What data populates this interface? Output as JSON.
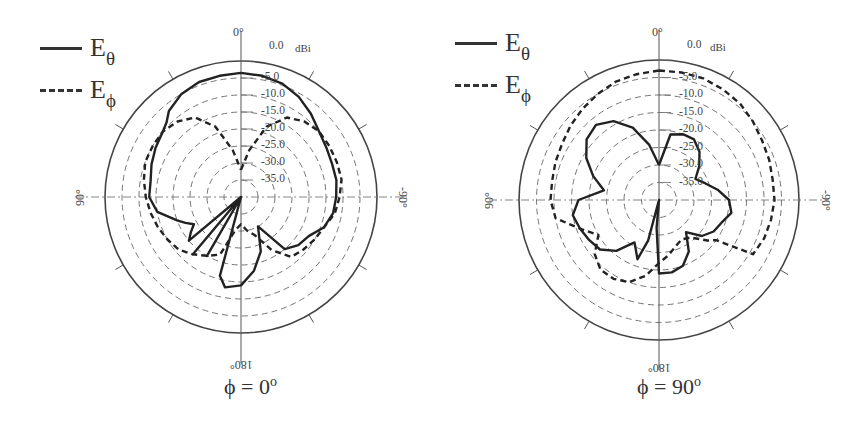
{
  "figure": {
    "unit_label": "dBi",
    "legend": [
      {
        "name": "E",
        "sub": "θ",
        "style": "solid"
      },
      {
        "name": "E",
        "sub": "ϕ",
        "style": "dashed"
      }
    ],
    "angle_labels": {
      "top": "0°",
      "left": "90°",
      "right": "-90°",
      "bottom": "180°"
    },
    "ring_labels": [
      "0.0",
      "-5.0",
      "-10.0",
      "-15.0",
      "-20.0",
      "-25.0",
      "-30.0",
      "-35.0"
    ]
  },
  "panels": [
    {
      "caption": "ϕ = 0",
      "caption_sup": "o"
    },
    {
      "caption": "ϕ = 90",
      "caption_sup": "o"
    }
  ],
  "chart_data": [
    {
      "type": "polar-line",
      "title": "ϕ = 0°",
      "radial_unit": "dBi",
      "rlim": [
        -40,
        0
      ],
      "radial_ticks": [
        0,
        -5,
        -10,
        -15,
        -20,
        -25,
        -30,
        -35
      ],
      "angle_ticks": [
        "0°",
        "90°",
        "180°",
        "-90°"
      ],
      "angle_convention": "theta in degrees, 0 at top, positive toward left (90° on left, -90° on right)",
      "legend_position": "top-left",
      "grid": true,
      "series": [
        {
          "name": "Eθ",
          "style": "solid",
          "theta": [
            0,
            -10,
            -20,
            -30,
            -40,
            -50,
            -60,
            -70,
            -80,
            -90,
            -100,
            -110,
            -120,
            -130,
            -140,
            -150,
            -160,
            -170,
            180,
            170,
            165,
            160,
            150,
            145,
            140,
            135,
            130,
            125,
            120,
            115,
            110,
            100,
            90,
            80,
            70,
            60,
            50,
            45,
            40,
            30,
            20,
            10,
            0
          ],
          "values": [
            -3.5,
            -3.8,
            -4.5,
            -6,
            -8,
            -10,
            -11,
            -11.5,
            -11.5,
            -12,
            -12.5,
            -14,
            -17,
            -18,
            -20,
            -30,
            -23,
            -18,
            -14,
            -13,
            -16,
            -40,
            -20,
            -40,
            -18,
            -40,
            -20,
            -22,
            -24,
            -22,
            -20,
            -15,
            -13,
            -13,
            -12,
            -11,
            -10,
            -9,
            -7,
            -5,
            -4,
            -3.8,
            -3.5
          ]
        },
        {
          "name": "Eϕ",
          "style": "dashed",
          "theta": [
            0,
            -10,
            -20,
            -30,
            -40,
            -50,
            -60,
            -70,
            -80,
            -90,
            -100,
            -110,
            -120,
            -130,
            -140,
            -150,
            -160,
            -170,
            180,
            170,
            160,
            150,
            140,
            130,
            120,
            110,
            100,
            90,
            80,
            70,
            60,
            50,
            40,
            30,
            20,
            10,
            0
          ],
          "values": [
            -32,
            -26,
            -18,
            -13,
            -11,
            -10,
            -10,
            -10,
            -10,
            -11,
            -12,
            -14,
            -15,
            -16,
            -17,
            -22,
            -28,
            -30,
            -32,
            -30,
            -22,
            -20,
            -18,
            -16,
            -15,
            -14,
            -13,
            -12,
            -11,
            -10,
            -10,
            -10,
            -11,
            -13,
            -18,
            -26,
            -32
          ]
        }
      ]
    },
    {
      "type": "polar-line",
      "title": "ϕ = 90°",
      "radial_unit": "dBi",
      "rlim": [
        -40,
        0
      ],
      "radial_ticks": [
        0,
        -5,
        -10,
        -15,
        -20,
        -25,
        -30,
        -35
      ],
      "angle_ticks": [
        "0°",
        "90°",
        "180°",
        "-90°"
      ],
      "angle_convention": "theta in degrees, 0 at top, positive toward left (90° on left, -90° on right)",
      "legend_position": "top-left",
      "grid": true,
      "series": [
        {
          "name": "Eθ",
          "style": "solid",
          "theta": [
            0,
            -10,
            -20,
            -30,
            -40,
            -50,
            -60,
            -70,
            -80,
            -90,
            -100,
            -110,
            -120,
            -130,
            -140,
            -150,
            -160,
            -170,
            180,
            175,
            170,
            165,
            160,
            150,
            140,
            130,
            120,
            110,
            100,
            90,
            80,
            70,
            60,
            50,
            40,
            30,
            20,
            10,
            0
          ],
          "values": [
            -30,
            -21,
            -20,
            -20,
            -22,
            -25,
            -28,
            -26,
            -23,
            -20,
            -19,
            -21,
            -22,
            -24,
            -28,
            -23,
            -20,
            -19,
            -19,
            -32,
            -40,
            -28,
            -22,
            -26,
            -21,
            -18,
            -17,
            -16,
            -15,
            -17,
            -24,
            -20,
            -16,
            -13,
            -12,
            -14,
            -18,
            -24,
            -30
          ]
        },
        {
          "name": "Eϕ",
          "style": "dashed",
          "theta": [
            0,
            -10,
            -20,
            -30,
            -40,
            -50,
            -60,
            -70,
            -80,
            -90,
            -100,
            -110,
            -120,
            -125,
            -130,
            -140,
            -150,
            -160,
            -170,
            180,
            170,
            160,
            150,
            140,
            130,
            120,
            110,
            100,
            90,
            80,
            70,
            60,
            50,
            40,
            30,
            20,
            10,
            0
          ],
          "values": [
            -3,
            -3,
            -3,
            -3.5,
            -4,
            -5,
            -6,
            -6.5,
            -7,
            -7,
            -7.5,
            -8,
            -9,
            -20,
            -22,
            -26,
            -27,
            -26,
            -24,
            -22,
            -18,
            -15,
            -14,
            -14,
            -16,
            -20,
            -16,
            -10,
            -9,
            -9,
            -8.5,
            -8,
            -7,
            -6,
            -5,
            -4,
            -3.5,
            -3
          ]
        }
      ]
    }
  ]
}
